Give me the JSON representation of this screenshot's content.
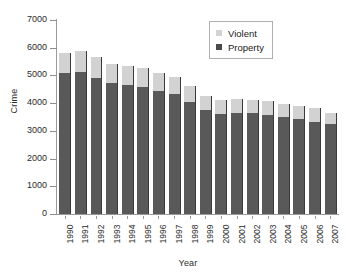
{
  "chart_data": {
    "type": "bar",
    "subtype": "stacked-bar",
    "title": "",
    "xlabel": "Year",
    "ylabel": "Crime",
    "ylim": [
      0,
      7000
    ],
    "ytick_step": 1000,
    "yticks": [
      "7000",
      "6000",
      "5000",
      "4000",
      "3000",
      "2000",
      "1000",
      "0"
    ],
    "grid": false,
    "legend_position": "top-right",
    "categories": [
      "1990",
      "1991",
      "1992",
      "1993",
      "1994",
      "1995",
      "1996",
      "1997",
      "1998",
      "1999",
      "2000",
      "2001",
      "2002",
      "2003",
      "2004",
      "2005",
      "2006",
      "2007"
    ],
    "series": [
      {
        "name": "Property",
        "color": "#595959",
        "values": [
          5090,
          5140,
          4900,
          4740,
          4660,
          4590,
          4450,
          4320,
          4050,
          3745,
          3620,
          3660,
          3630,
          3590,
          3515,
          3430,
          3335,
          3265
        ]
      },
      {
        "name": "Violent",
        "color": "#d2d2d2",
        "values": [
          730,
          760,
          760,
          690,
          690,
          680,
          640,
          610,
          570,
          525,
          505,
          500,
          495,
          475,
          465,
          470,
          475,
          395
        ]
      }
    ],
    "totals": [
      5820,
      5900,
      5660,
      5430,
      5350,
      5270,
      5090,
      4930,
      4620,
      4270,
      4125,
      4160,
      4125,
      4065,
      3980,
      3900,
      3810,
      3660
    ]
  },
  "legend": {
    "items": [
      {
        "label": "Violent",
        "swatch": "violent-swatch"
      },
      {
        "label": "Property",
        "swatch": "property-swatch"
      }
    ]
  },
  "axes": {
    "y_title": "Crime",
    "x_title": "Year"
  }
}
